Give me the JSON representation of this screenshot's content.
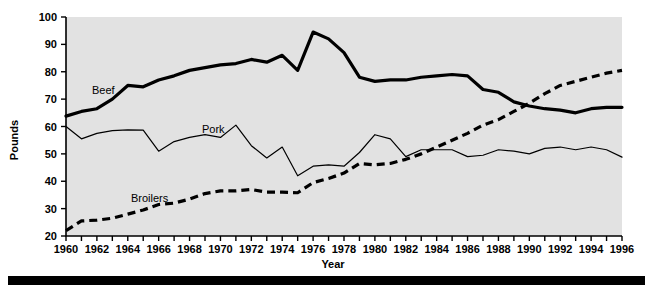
{
  "figure": {
    "background_color": "#ffffff",
    "plot_background_color": "#e2e2e2",
    "line_color": "#000000"
  },
  "axis": {
    "x_title": "Year",
    "y_title": "Pounds",
    "y_ticks": [
      "20",
      "30",
      "40",
      "50",
      "60",
      "70",
      "80",
      "90",
      "100"
    ],
    "x_ticks": [
      "1960",
      "1962",
      "1964",
      "1966",
      "1968",
      "1970",
      "1972",
      "1974",
      "1976",
      "1978",
      "1980",
      "1982",
      "1984",
      "1986",
      "1988",
      "1990",
      "1992",
      "1994",
      "1996"
    ]
  },
  "series_labels": {
    "beef": "Beef",
    "pork": "Pork",
    "broilers": "Broilers"
  },
  "chart_data": {
    "type": "line",
    "title": "",
    "xlabel": "Year",
    "ylabel": "Pounds",
    "xlim": [
      1960,
      1996
    ],
    "ylim": [
      20,
      100
    ],
    "ytick_step": 10,
    "xtick_step": 1,
    "xtick_label_step": 2,
    "grid": false,
    "legend": "inline-labels",
    "x": [
      1960,
      1961,
      1962,
      1963,
      1964,
      1965,
      1966,
      1967,
      1968,
      1969,
      1970,
      1971,
      1972,
      1973,
      1974,
      1975,
      1976,
      1977,
      1978,
      1979,
      1980,
      1981,
      1982,
      1983,
      1984,
      1985,
      1986,
      1987,
      1988,
      1989,
      1990,
      1991,
      1992,
      1993,
      1994,
      1995,
      1996
    ],
    "series": [
      {
        "name": "Beef",
        "style": "thick-solid",
        "values": [
          63.8,
          65.5,
          66.5,
          70.0,
          75.0,
          74.5,
          77.0,
          78.5,
          80.5,
          81.5,
          82.5,
          83.0,
          84.5,
          83.5,
          86.0,
          80.5,
          94.5,
          92.0,
          87.0,
          78.0,
          76.5,
          77.0,
          77.0,
          78.0,
          78.5,
          79.0,
          78.5,
          73.5,
          72.5,
          69.0,
          67.5,
          66.5,
          66.0,
          65.0,
          66.5,
          67.0,
          67.0
        ]
      },
      {
        "name": "Pork",
        "style": "thin-solid",
        "values": [
          60.0,
          55.5,
          57.5,
          58.5,
          58.8,
          58.7,
          51.0,
          54.5,
          56.0,
          57.0,
          56.0,
          60.5,
          53.0,
          48.5,
          52.5,
          42.0,
          45.5,
          46.0,
          45.5,
          50.5,
          57.0,
          55.5,
          49.0,
          51.5,
          51.5,
          51.5,
          49.0,
          49.5,
          51.5,
          51.0,
          50.0,
          52.0,
          52.5,
          51.5,
          52.5,
          51.5,
          48.8
        ]
      },
      {
        "name": "Broilers",
        "style": "thick-dashed",
        "values": [
          22.0,
          25.5,
          25.8,
          26.5,
          28.0,
          29.5,
          31.5,
          32.0,
          33.5,
          35.5,
          36.5,
          36.5,
          37.0,
          36.0,
          36.0,
          35.8,
          39.5,
          41.0,
          43.0,
          46.5,
          46.0,
          46.5,
          48.0,
          50.0,
          52.5,
          55.0,
          57.5,
          60.5,
          62.5,
          65.5,
          68.5,
          72.0,
          75.0,
          76.5,
          78.0,
          79.5,
          80.5
        ]
      }
    ]
  }
}
